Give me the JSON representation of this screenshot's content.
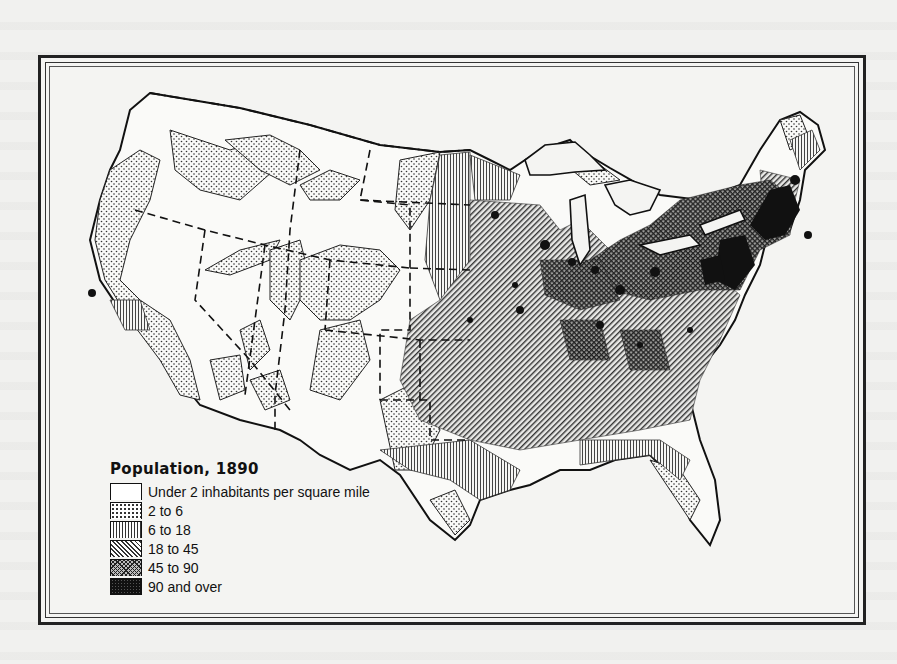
{
  "map": {
    "title": "Population, 1890",
    "subject": "Population density of the United States, 1890",
    "legend": [
      {
        "label": "Under 2 inhabitants per square mile",
        "pattern": "blank"
      },
      {
        "label": "2 to 6",
        "pattern": "dots"
      },
      {
        "label": "6 to 18",
        "pattern": "vertical-lines"
      },
      {
        "label": "18 to 45",
        "pattern": "diagonal-lines"
      },
      {
        "label": "45 to 90",
        "pattern": "cross-hatch"
      },
      {
        "label": "90 and over",
        "pattern": "solid-black"
      }
    ],
    "colors": {
      "ink": "#111111",
      "paper": "#f1f1ef"
    }
  }
}
